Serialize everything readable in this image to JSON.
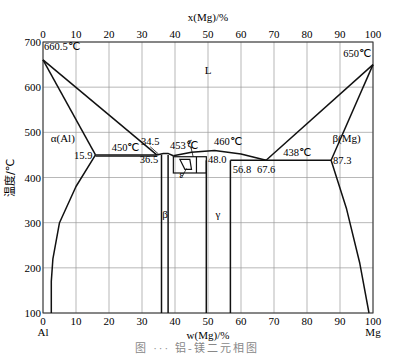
{
  "chart_data": {
    "type": "line",
    "top_axis_label": "x(Mg)/%",
    "xlabel": "w(Mg)/%",
    "ylabel": "温度/℃",
    "xlim": [
      0,
      100
    ],
    "ylim": [
      100,
      700
    ],
    "x_ticks": [
      0,
      10,
      20,
      30,
      40,
      50,
      60,
      70,
      80,
      90,
      100
    ],
    "top_x_ticks": [
      0,
      10,
      20,
      30,
      40,
      50,
      60,
      70,
      80,
      90,
      100
    ],
    "y_ticks": [
      100,
      200,
      300,
      400,
      500,
      600,
      700
    ],
    "grid": true,
    "x_end_labels": {
      "left": "Al",
      "right": "Mg"
    },
    "phase_labels": [
      {
        "text": "L",
        "x": 50,
        "y": 630
      },
      {
        "text": "α(Al)",
        "x": 6,
        "y": 478
      },
      {
        "text": "β(Mg)",
        "x": 92,
        "y": 478
      },
      {
        "text": "β",
        "x": 37,
        "y": 310
      },
      {
        "text": "γ",
        "x": 53,
        "y": 310
      },
      {
        "text": "ε",
        "x": 42,
        "y": 398
      },
      {
        "text": "ζ",
        "x": 44.5,
        "y": 468
      }
    ],
    "annotations": [
      {
        "text": "660.5℃",
        "x": 0,
        "y": 660.5
      },
      {
        "text": "650℃",
        "x": 100,
        "y": 650
      },
      {
        "text": "450℃",
        "x": 25,
        "y": 450
      },
      {
        "text": "453℃",
        "x": 38,
        "y": 453
      },
      {
        "text": "460℃",
        "x": 55,
        "y": 460
      },
      {
        "text": "438℃",
        "x": 77,
        "y": 438
      },
      {
        "text": "15.9",
        "x": 15.9,
        "y": 450
      },
      {
        "text": "34.5",
        "x": 34.5,
        "y": 450
      },
      {
        "text": "36.5",
        "x": 36.5,
        "y": 450
      },
      {
        "text": "48.0",
        "x": 48.0,
        "y": 438
      },
      {
        "text": "56.8",
        "x": 56.8,
        "y": 438
      },
      {
        "text": "67.6",
        "x": 67.6,
        "y": 438
      },
      {
        "text": "87.3",
        "x": 87.3,
        "y": 438
      }
    ],
    "series": [
      {
        "name": "liquidus-Al",
        "points": [
          [
            0,
            660.5
          ],
          [
            34.5,
            450
          ]
        ]
      },
      {
        "name": "solidus-Al",
        "points": [
          [
            0,
            660.5
          ],
          [
            15.9,
            450
          ]
        ]
      },
      {
        "name": "solvus-Al",
        "points": [
          [
            15.9,
            450
          ],
          [
            10,
            380
          ],
          [
            5,
            300
          ],
          [
            3,
            220
          ],
          [
            2.5,
            170
          ],
          [
            2.5,
            100
          ]
        ]
      },
      {
        "name": "eutectic-450",
        "points": [
          [
            15.9,
            450
          ],
          [
            34.5,
            450
          ]
        ]
      },
      {
        "name": "liquidus-beta-dome",
        "points": [
          [
            34.5,
            450
          ],
          [
            36.5,
            453
          ],
          [
            38,
            453
          ],
          [
            39.5,
            448
          ]
        ]
      },
      {
        "name": "liquidus-gamma-dome",
        "points": [
          [
            39.5,
            448
          ],
          [
            45,
            456
          ],
          [
            52,
            460
          ],
          [
            60,
            452
          ],
          [
            67.6,
            438
          ]
        ]
      },
      {
        "name": "beta-left",
        "points": [
          [
            35.9,
            450
          ],
          [
            35.9,
            100
          ]
        ]
      },
      {
        "name": "beta-right",
        "points": [
          [
            37.9,
            450
          ],
          [
            37.9,
            100
          ]
        ]
      },
      {
        "name": "gamma-left",
        "points": [
          [
            49.5,
            438
          ],
          [
            49.5,
            100
          ]
        ]
      },
      {
        "name": "gamma-right",
        "points": [
          [
            56.8,
            438
          ],
          [
            56.8,
            100
          ]
        ]
      },
      {
        "name": "eutectic-438",
        "points": [
          [
            56.8,
            438
          ],
          [
            87.3,
            438
          ]
        ]
      },
      {
        "name": "liquidus-Mg",
        "points": [
          [
            67.6,
            438
          ],
          [
            100,
            650
          ]
        ]
      },
      {
        "name": "solidus-Mg",
        "points": [
          [
            87.3,
            438
          ],
          [
            100,
            650
          ]
        ]
      },
      {
        "name": "solvus-Mg",
        "points": [
          [
            87.3,
            438
          ],
          [
            92,
            330
          ],
          [
            96,
            210
          ],
          [
            98.8,
            100
          ]
        ]
      }
    ]
  },
  "axes": {
    "top_label": "x(Mg)/%",
    "bottom_label": "w(Mg)/%",
    "y_label": "温度/℃",
    "left_end": "Al",
    "right_end": "Mg"
  },
  "caption": "图 ··· 铝-镁二元相图"
}
